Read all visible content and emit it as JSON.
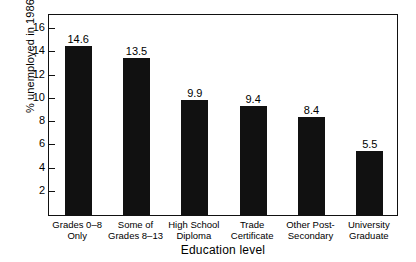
{
  "chart_data": {
    "type": "bar",
    "title": "",
    "xlabel": "Education level",
    "ylabel": "% unemployed in 1986",
    "categories": [
      "Grades 0–8 Only",
      "Some of Grades 8–13",
      "High School Diploma",
      "Trade Certificate",
      "Other Post-Secondary",
      "University Graduate"
    ],
    "category_lines": [
      [
        "Grades 0–8",
        "Only"
      ],
      [
        "Some of",
        "Grades 8–13"
      ],
      [
        "High School",
        "Diploma"
      ],
      [
        "Trade",
        "Certificate"
      ],
      [
        "Other Post-",
        "Secondary"
      ],
      [
        "University",
        "Graduate"
      ]
    ],
    "values": [
      14.6,
      13.5,
      9.9,
      9.4,
      8.4,
      5.5
    ],
    "value_labels": [
      "14.6",
      "13.5",
      "9.9",
      "9.4",
      "8.4",
      "5.5"
    ],
    "ylim": [
      0,
      17.4
    ],
    "yticks": [
      2,
      4,
      6,
      8,
      10,
      12,
      14,
      16
    ],
    "ytick_labels": [
      "2",
      "4",
      "6",
      "8",
      "10",
      "12",
      "14",
      "16"
    ],
    "grid": false,
    "legend": false,
    "bar_color": "#111111",
    "background_color": "#ffffff",
    "frame_color": "#111111"
  }
}
